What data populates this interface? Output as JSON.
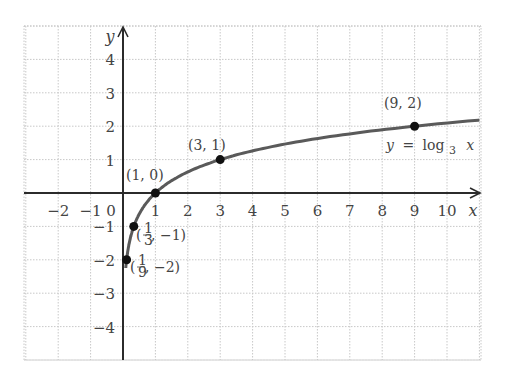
{
  "chart_data": {
    "type": "line",
    "title": "",
    "function_label": "y = log3 x",
    "function_label_parts": {
      "lhs": "y",
      "eq": "=",
      "fn": "log",
      "base": "3",
      "arg": "x"
    },
    "xlabel": "x",
    "ylabel": "y",
    "xlim": [
      -3,
      11
    ],
    "ylim": [
      -5,
      5
    ],
    "grid": true,
    "x_ticks": [
      "−2",
      "−1",
      "0",
      "1",
      "2",
      "3",
      "4",
      "5",
      "6",
      "7",
      "8",
      "9",
      "10"
    ],
    "y_ticks": [
      "4",
      "3",
      "2",
      "1",
      "−1",
      "−2",
      "−3",
      "−4"
    ],
    "points": [
      {
        "x": 0.1111,
        "y": -2,
        "label": "(1/9, −2)",
        "label_frac": {
          "num": "1",
          "den": "9",
          "rest": ", −2)"
        }
      },
      {
        "x": 0.3333,
        "y": -1,
        "label": "(1/3, −1)",
        "label_frac": {
          "num": "1",
          "den": "3",
          "rest": ", −1)"
        }
      },
      {
        "x": 1,
        "y": 0,
        "label": "(1, 0)"
      },
      {
        "x": 3,
        "y": 1,
        "label": "(3, 1)"
      },
      {
        "x": 9,
        "y": 2,
        "label": "(9, 2)"
      }
    ],
    "series": [
      {
        "name": "y = log3 x",
        "function": "log3(x)",
        "x_range": [
          0.05,
          11
        ]
      }
    ]
  },
  "colors": {
    "axis": "#2b2b2b",
    "curve": "#5a5a5a",
    "grid": "#c8c8c8",
    "point": "#111111",
    "text": "#444444"
  }
}
